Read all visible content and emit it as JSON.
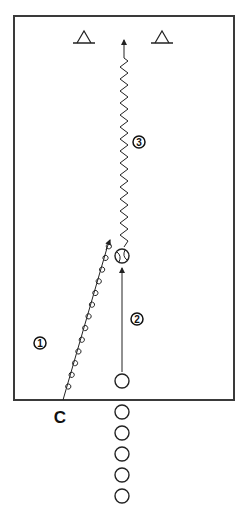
{
  "diagram": {
    "colors": {
      "stroke": "#222222",
      "frame": "#3a3a3a",
      "background": "#ffffff"
    },
    "coach": {
      "label": "C"
    },
    "cones": [
      {
        "name": "cone-left"
      },
      {
        "name": "cone-right"
      }
    ],
    "ball": {
      "name": "ball"
    },
    "players_in_line": 6,
    "steps": [
      {
        "number": "1",
        "description": "Coach passes/serves ball (looped line)"
      },
      {
        "number": "2",
        "description": "Player runs to ball"
      },
      {
        "number": "3",
        "description": "Player dribbles ball upfield between cones"
      }
    ]
  }
}
